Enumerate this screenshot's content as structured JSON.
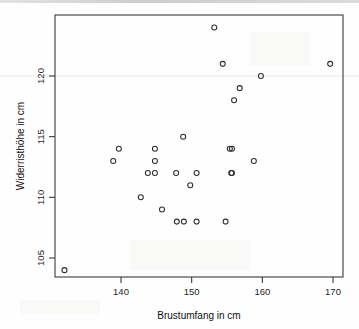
{
  "chart_data": {
    "type": "scatter",
    "title": "",
    "subtitle": "",
    "xlabel": "Brustumfang in cm",
    "ylabel": "Widerristhöhe in cm",
    "xlim": [
      131,
      171
    ],
    "ylim": [
      103.2,
      124.8
    ],
    "xticks": [
      140,
      150,
      160,
      170
    ],
    "yticks": [
      105,
      110,
      115,
      120
    ],
    "xtick_labels": [
      "140",
      "150",
      "160",
      "170"
    ],
    "ytick_labels": [
      "105",
      "110",
      "115",
      "120"
    ],
    "grid": false,
    "legend": null,
    "marker": "open-circle",
    "marker_color": "#2e2e2e",
    "n_points": 31,
    "x": [
      132,
      138.9,
      139.7,
      142.8,
      143.8,
      144.8,
      144.8,
      144.8,
      145.8,
      147.8,
      147.9,
      148.8,
      148.9,
      149.8,
      150.7,
      150.7,
      153.2,
      154.4,
      154.8,
      155.4,
      155.6,
      155.7,
      155.7,
      156,
      156.8,
      158.8,
      159.8,
      169.6
    ],
    "y": [
      104,
      113,
      114,
      110,
      112,
      114,
      113,
      112,
      109,
      112,
      108,
      115,
      108,
      111,
      112,
      108,
      124,
      121,
      108,
      114,
      112,
      114,
      112,
      118,
      119,
      113,
      120,
      121
    ],
    "points": [
      {
        "x": 132.0,
        "y": 104
      },
      {
        "x": 138.9,
        "y": 113
      },
      {
        "x": 139.7,
        "y": 114
      },
      {
        "x": 142.8,
        "y": 110
      },
      {
        "x": 143.8,
        "y": 112
      },
      {
        "x": 144.8,
        "y": 114
      },
      {
        "x": 144.8,
        "y": 113
      },
      {
        "x": 144.8,
        "y": 112
      },
      {
        "x": 145.8,
        "y": 109
      },
      {
        "x": 147.8,
        "y": 112
      },
      {
        "x": 147.9,
        "y": 108
      },
      {
        "x": 148.8,
        "y": 115
      },
      {
        "x": 148.9,
        "y": 108
      },
      {
        "x": 149.8,
        "y": 111
      },
      {
        "x": 150.7,
        "y": 112
      },
      {
        "x": 150.7,
        "y": 108
      },
      {
        "x": 153.2,
        "y": 124
      },
      {
        "x": 154.4,
        "y": 121
      },
      {
        "x": 154.8,
        "y": 108
      },
      {
        "x": 155.4,
        "y": 114
      },
      {
        "x": 155.6,
        "y": 112
      },
      {
        "x": 155.7,
        "y": 114
      },
      {
        "x": 155.7,
        "y": 112
      },
      {
        "x": 156.0,
        "y": 118
      },
      {
        "x": 156.8,
        "y": 119
      },
      {
        "x": 158.8,
        "y": 113
      },
      {
        "x": 159.8,
        "y": 120
      },
      {
        "x": 169.6,
        "y": 121
      }
    ]
  },
  "figure": {
    "background_color": "#fefefe",
    "frame_color": "#3a3a3a",
    "text_color": "#1f1f1f"
  }
}
